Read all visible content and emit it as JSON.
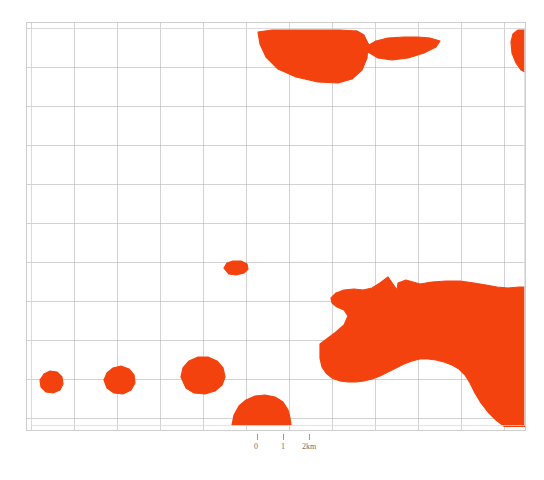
{
  "figure": {
    "kind": "thematic-map",
    "background_color": "#ffffff"
  },
  "map": {
    "frame": {
      "left": 26,
      "top": 22,
      "right": 525,
      "bottom": 430,
      "border_color": "#c9c9c9",
      "inner_border_color": "#dcdcdc"
    },
    "graticule": {
      "line_color": "#b5b5b5",
      "line_width": 0.6,
      "vertical_x": [
        31,
        74,
        117,
        160,
        203,
        246,
        289,
        332,
        375,
        418,
        461,
        504
      ],
      "horizontal_y": [
        28,
        67,
        106,
        145,
        184,
        223,
        262,
        301,
        340,
        379,
        418
      ]
    },
    "fill_color": "#f4420e",
    "regions": [
      {
        "name": "north-central-mass",
        "points": "258,32 260,44 266,57 278,69 296,77 318,82 338,83 352,79 362,70 367,58 368,44 364,35 357,31 340,30 300,30 272,30"
      },
      {
        "name": "north-central-tail",
        "points": "356,31 364,37 369,45 376,41 388,38 404,37 418,37 430,38 440,41 436,47 424,53 408,58 392,60 378,58 368,52 361,43"
      },
      {
        "name": "north-east-edge-sliver",
        "points": "525,30 525,72 521,70 516,63 512,53 511,42 513,34 518,30"
      },
      {
        "name": "mid-small-ellipse",
        "points": "224,268 227,263 233,261 241,261 247,264 248,269 244,273 236,275 229,274"
      },
      {
        "name": "southeast-large-mass",
        "points": "320,344 328,338 336,332 344,325 348,316 344,310 337,307 332,303 331,298 336,293 344,290 354,289 363,290 372,288 380,283 388,277 397,290 398,283 406,280 420,284 432,282 446,281 460,281 474,283 486,285 497,287 508,288 519,287 525,287 525,430 513,430 505,427 496,420 488,412 481,403 475,393 470,383 465,375 459,369 452,365 444,362 436,360 428,359 420,359 412,361 404,364 396,368 388,372 380,376 372,379 364,381 356,382 348,382 340,381 332,378 326,373 322,367 320,358"
      },
      {
        "name": "southwest-blob-a",
        "points": "40,380 44,374 50,371 57,372 62,377 63,384 60,390 53,393 46,392 41,387"
      },
      {
        "name": "southwest-blob-b",
        "points": "104,380 107,373 113,368 121,366 129,369 134,375 135,383 131,390 123,394 114,393 107,388"
      },
      {
        "name": "southwest-blob-c",
        "points": "181,377 183,368 189,361 198,357 208,357 217,361 223,368 225,377 222,385 215,391 205,394 194,393 186,388"
      },
      {
        "name": "south-dome",
        "points": "232,425 234,415 239,406 246,400 255,396 265,395 275,397 283,402 288,410 290,418 291,425"
      }
    ]
  },
  "scale_bar": {
    "labels": {
      "start": "0",
      "middle": "1",
      "end": "2km"
    },
    "tick_color": "#9a9a9a",
    "text_color": "#6f6f6f"
  }
}
